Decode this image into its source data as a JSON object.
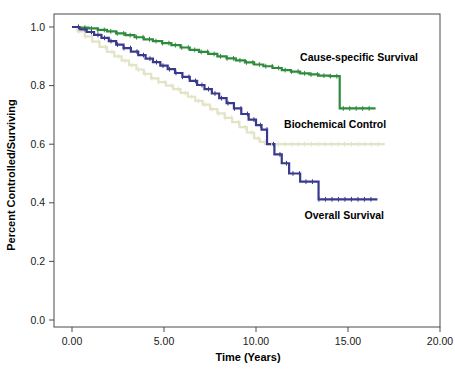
{
  "chart_data": {
    "type": "line",
    "title": "",
    "xlabel": "Time (Years)",
    "ylabel": "Percent Controlled/Surviving",
    "xlim": [
      0.0,
      20.0
    ],
    "ylim": [
      0.0,
      1.0
    ],
    "xticks": [
      "0.00",
      "5.00",
      "10.00",
      "15.00",
      "20.00"
    ],
    "xtick_values": [
      0.0,
      5.0,
      10.0,
      15.0,
      20.0
    ],
    "yticks": [
      "0.0",
      "0.2",
      "0.4",
      "0.6",
      "0.8",
      "1.0"
    ],
    "ytick_values": [
      0.0,
      0.2,
      0.4,
      0.6,
      0.8,
      1.0
    ],
    "grid": false,
    "legend_position": "inline-annotations",
    "series": [
      {
        "name": "Cause-specific Survival",
        "color": "#2E8B3C",
        "annotation_x": 15.6,
        "annotation_y": 0.885,
        "x": [
          0.0,
          0.4,
          0.9,
          1.4,
          1.9,
          2.4,
          2.9,
          3.4,
          3.9,
          4.4,
          4.9,
          5.4,
          5.9,
          6.4,
          6.9,
          7.4,
          7.9,
          8.4,
          8.9,
          9.4,
          9.9,
          10.4,
          10.9,
          11.4,
          11.9,
          12.4,
          12.9,
          13.4,
          14.0,
          14.55,
          14.55,
          16.5
        ],
        "y": [
          1.0,
          0.998,
          0.995,
          0.99,
          0.985,
          0.978,
          0.972,
          0.965,
          0.958,
          0.952,
          0.945,
          0.938,
          0.93,
          0.922,
          0.915,
          0.908,
          0.9,
          0.893,
          0.886,
          0.879,
          0.872,
          0.866,
          0.86,
          0.853,
          0.848,
          0.842,
          0.838,
          0.834,
          0.832,
          0.832,
          0.722,
          0.722
        ]
      },
      {
        "name": "Biochemical Control",
        "color": "#E3E3C8",
        "annotation_x": 14.3,
        "annotation_y": 0.655,
        "x": [
          0.0,
          0.3,
          0.7,
          1.1,
          1.5,
          1.9,
          2.3,
          2.7,
          3.1,
          3.5,
          3.9,
          4.3,
          4.7,
          5.1,
          5.5,
          5.9,
          6.3,
          6.7,
          7.1,
          7.5,
          7.9,
          8.3,
          8.7,
          9.1,
          9.5,
          9.9,
          10.2,
          10.5,
          17.0
        ],
        "y": [
          1.0,
          0.985,
          0.968,
          0.95,
          0.932,
          0.915,
          0.9,
          0.885,
          0.87,
          0.855,
          0.84,
          0.825,
          0.812,
          0.8,
          0.788,
          0.775,
          0.762,
          0.748,
          0.735,
          0.72,
          0.705,
          0.69,
          0.675,
          0.658,
          0.64,
          0.62,
          0.608,
          0.6,
          0.6
        ]
      },
      {
        "name": "Overall Survival",
        "color": "#3A3A8C",
        "annotation_x": 14.8,
        "annotation_y": 0.345,
        "x": [
          0.0,
          0.4,
          0.8,
          1.2,
          1.6,
          2.0,
          2.4,
          2.8,
          3.2,
          3.6,
          4.0,
          4.4,
          4.8,
          5.2,
          5.6,
          6.0,
          6.4,
          6.8,
          7.2,
          7.6,
          8.0,
          8.4,
          8.8,
          9.2,
          9.6,
          10.0,
          10.3,
          10.6,
          10.6,
          11.0,
          11.0,
          11.4,
          11.4,
          11.8,
          11.8,
          12.4,
          12.4,
          13.4,
          13.4,
          16.6
        ],
        "y": [
          1.0,
          0.992,
          0.983,
          0.973,
          0.963,
          0.952,
          0.94,
          0.928,
          0.916,
          0.904,
          0.892,
          0.88,
          0.868,
          0.856,
          0.843,
          0.83,
          0.816,
          0.802,
          0.788,
          0.773,
          0.757,
          0.74,
          0.722,
          0.703,
          0.684,
          0.665,
          0.65,
          0.64,
          0.6,
          0.6,
          0.565,
          0.565,
          0.535,
          0.535,
          0.5,
          0.5,
          0.472,
          0.472,
          0.412,
          0.412
        ]
      }
    ]
  },
  "annotations": {
    "cause_specific": "Cause-specific Survival",
    "biochemical": "Biochemical Control",
    "overall": "Overall Survival"
  },
  "axes": {
    "x_title": "Time (Years)",
    "y_title": "Percent Controlled/Surviving"
  }
}
